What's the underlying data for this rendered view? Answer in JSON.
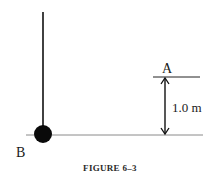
{
  "figure": {
    "caption": "FIGURE 6–3",
    "labels": {
      "point_a": "A",
      "point_b": "B",
      "height": "1.0 m"
    },
    "elements": {
      "pendulum_string": "vertical line",
      "pendulum_bob": "black ball at B",
      "reference_level_a": "horizontal line at A",
      "reference_level_b": "horizontal baseline at B",
      "height_arrow": "double-headed arrow"
    },
    "colors": {
      "ink": "#111111",
      "baseline": "#8a8a8a",
      "background": "#ffffff"
    }
  }
}
